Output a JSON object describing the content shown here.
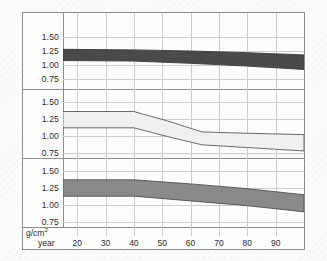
{
  "chart_data": {
    "type": "area",
    "title": "",
    "xlabel": "year",
    "ylabel": "g/cm2",
    "unit_label": "g/cm",
    "unit_superscript": "2",
    "grid": true,
    "legend": "none",
    "xlim": [
      15,
      100
    ],
    "ylim": [
      0.62,
      1.62
    ],
    "yticks": [
      "1.50",
      "1.25",
      "1.00",
      "0.75"
    ],
    "ytick_values": [
      1.5,
      1.25,
      1.0,
      0.75
    ],
    "xticks": [
      "20",
      "30",
      "40",
      "50",
      "60",
      "70",
      "80",
      "90"
    ],
    "xtick_values": [
      20,
      30,
      40,
      50,
      60,
      70,
      80,
      90
    ],
    "panels": [
      {
        "name": "panel-top",
        "fill_color": "#4a4a4a",
        "stroke_color": "#3a3a3a",
        "upper": [
          {
            "x": 15,
            "y": 1.28
          },
          {
            "x": 40,
            "y": 1.27
          },
          {
            "x": 60,
            "y": 1.25
          },
          {
            "x": 80,
            "y": 1.22
          },
          {
            "x": 100,
            "y": 1.18
          }
        ],
        "lower": [
          {
            "x": 15,
            "y": 1.08
          },
          {
            "x": 40,
            "y": 1.07
          },
          {
            "x": 60,
            "y": 1.03
          },
          {
            "x": 80,
            "y": 0.98
          },
          {
            "x": 100,
            "y": 0.92
          }
        ]
      },
      {
        "name": "panel-middle",
        "fill_color": "#f0f0f0",
        "stroke_color": "#5a5a5a",
        "upper": [
          {
            "x": 15,
            "y": 1.36
          },
          {
            "x": 40,
            "y": 1.36
          },
          {
            "x": 52,
            "y": 1.22
          },
          {
            "x": 64,
            "y": 1.06
          },
          {
            "x": 80,
            "y": 1.04
          },
          {
            "x": 100,
            "y": 1.02
          }
        ],
        "lower": [
          {
            "x": 15,
            "y": 1.12
          },
          {
            "x": 40,
            "y": 1.12
          },
          {
            "x": 52,
            "y": 0.99
          },
          {
            "x": 64,
            "y": 0.87
          },
          {
            "x": 80,
            "y": 0.83
          },
          {
            "x": 100,
            "y": 0.78
          }
        ]
      },
      {
        "name": "panel-bottom",
        "fill_color": "#8a8a8a",
        "stroke_color": "#4f4f4f",
        "upper": [
          {
            "x": 15,
            "y": 1.37
          },
          {
            "x": 40,
            "y": 1.37
          },
          {
            "x": 60,
            "y": 1.31
          },
          {
            "x": 80,
            "y": 1.24
          },
          {
            "x": 100,
            "y": 1.15
          }
        ],
        "lower": [
          {
            "x": 15,
            "y": 1.13
          },
          {
            "x": 40,
            "y": 1.13
          },
          {
            "x": 60,
            "y": 1.06
          },
          {
            "x": 80,
            "y": 0.99
          },
          {
            "x": 100,
            "y": 0.9
          }
        ]
      }
    ]
  }
}
